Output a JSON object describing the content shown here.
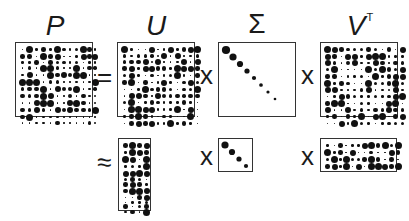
{
  "labels": {
    "P": "P",
    "U": "U",
    "Sigma": "Σ",
    "V": "V",
    "V_sup": "T"
  },
  "operators": {
    "equals": "=",
    "times1": "x",
    "times2": "x",
    "approx": "≈",
    "times3": "x",
    "times4": "x"
  },
  "colors": {
    "dot": "#111111",
    "border": "#333333",
    "text": "#1a1a1a"
  },
  "matrices": {
    "P": {
      "rows": 12,
      "cols": 12,
      "seed": 3
    },
    "U": {
      "rows": 12,
      "cols": 12,
      "seed": 11
    },
    "Sigma": {
      "size": 8,
      "diag_sizes": [
        7,
        6,
        5,
        4,
        3,
        2.5,
        2,
        1.5
      ]
    },
    "VT": {
      "rows": 12,
      "cols": 12,
      "seed": 23
    },
    "Uk": {
      "rows": 12,
      "cols": 4,
      "seed": 37
    },
    "Sigmak": {
      "size": 4,
      "diag_sizes": [
        6,
        5,
        4,
        3
      ]
    },
    "VkT": {
      "rows": 4,
      "cols": 12,
      "seed": 51
    }
  }
}
